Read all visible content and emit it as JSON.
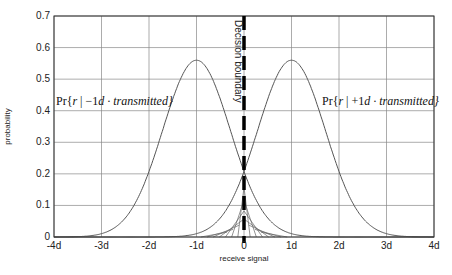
{
  "chart_data": {
    "type": "line",
    "title": "",
    "xlabel": "receive signal",
    "ylabel": "probability",
    "xlim": [
      -4,
      4
    ],
    "ylim": [
      0,
      0.7
    ],
    "grid": true,
    "x_tick_labels": [
      "-4d",
      "-3d",
      "-2d",
      "-1d",
      "0",
      "1d",
      "2d",
      "3d",
      "4d"
    ],
    "y_tick_labels": [
      "0",
      "0.1",
      "0.2",
      "0.3",
      "0.4",
      "0.5",
      "0.6",
      "0.7"
    ],
    "series": [
      {
        "name": "Pr{r | -1d · transmitted}",
        "mean": -1,
        "sigma": 0.71,
        "peak": 0.56
      },
      {
        "name": "Pr{r | +1d · transmitted}",
        "mean": 1,
        "sigma": 0.71,
        "peak": 0.56
      }
    ],
    "annotations": [
      {
        "text": "Decision boundary",
        "x": 0,
        "style": "thick dashed vertical line"
      },
      {
        "text": "hatched overlap region (error probability)",
        "x_range": [
          -1,
          1
        ]
      }
    ],
    "labels": {
      "left_curve": {
        "prefix": "Pr{",
        "r": "r",
        "mid": " | −1",
        "d": "d",
        "rest": " · transmitted}"
      },
      "right_curve": {
        "prefix": "Pr{",
        "r": "r",
        "mid": " | +1",
        "d": "d",
        "rest": " · transmitted}"
      }
    }
  }
}
